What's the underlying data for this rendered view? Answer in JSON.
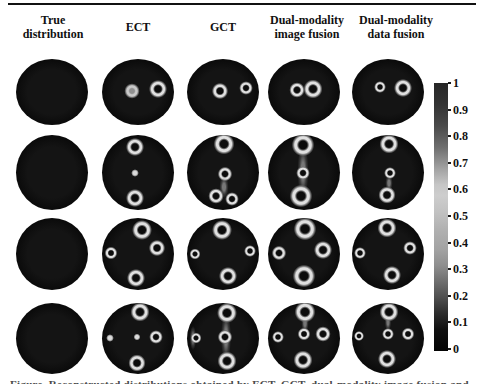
{
  "figure": {
    "columns": [
      {
        "label": "True\ndistribution"
      },
      {
        "label": "ECT"
      },
      {
        "label": "GCT"
      },
      {
        "label": "Dual-modality\nimage fusion"
      },
      {
        "label": "Dual-modality\ndata fusion"
      }
    ],
    "caption_fragment": "Figure. Reconstructed distributions obtained by ECT, GCT, dual-modality image fusion and dual-modality data fusion"
  },
  "colorbar": {
    "max": "1",
    "min": "0",
    "labels": [
      "1",
      "0.9",
      "0.8",
      "0.7",
      "0.6",
      "0.5",
      "0.4",
      "0.3",
      "0.2",
      "0.1",
      "0"
    ],
    "colormap_grayscale": [
      "#272727",
      "#cdcdcd",
      "#a3a3a3",
      "#4f4f4f",
      "#040404"
    ]
  },
  "colors": {
    "background": "#ffffff",
    "disc": "#0d0d0d",
    "ring_bright": "#e0e0e0",
    "text": "#111111"
  },
  "grid": {
    "cols": [
      {
        "cx": 52
      },
      {
        "cx": 138
      },
      {
        "cx": 223
      },
      {
        "cx": 304
      },
      {
        "cx": 388
      }
    ],
    "rows": [
      {
        "cy": 92,
        "h": 66
      },
      {
        "cy": 172,
        "h": 75
      },
      {
        "cy": 254,
        "h": 72
      },
      {
        "cy": 338,
        "h": 71
      }
    ],
    "cells": [
      [
        [],
        [
          {
            "x": 42,
            "y": 49,
            "d": 17,
            "t": "ring2"
          },
          {
            "x": 78,
            "y": 45,
            "d": 20,
            "t": "ring"
          }
        ],
        [
          {
            "x": 46,
            "y": 48,
            "d": 18,
            "t": "ring"
          },
          {
            "x": 82,
            "y": 44,
            "d": 15,
            "t": "ring"
          }
        ],
        [
          {
            "x": 40,
            "y": 47,
            "d": 17,
            "t": "ring"
          },
          {
            "x": 63,
            "y": 45,
            "d": 21,
            "t": "ring"
          }
        ],
        [
          {
            "x": 39,
            "y": 43,
            "d": 13,
            "t": "ring"
          },
          {
            "x": 71,
            "y": 44,
            "d": 20,
            "t": "ring"
          }
        ]
      ],
      [
        [],
        [
          {
            "x": 46,
            "y": 16,
            "d": 20,
            "t": "ring"
          },
          {
            "x": 46,
            "y": 51,
            "d": 9,
            "t": "dot"
          },
          {
            "x": 46,
            "y": 84,
            "d": 20,
            "t": "ring"
          }
        ],
        [
          {
            "x": 52,
            "y": 13,
            "d": 23,
            "t": "ring"
          },
          {
            "x": 53,
            "y": 52,
            "d": 16,
            "t": "ring"
          },
          {
            "x": 52,
            "y": 70,
            "d": 10,
            "h": 24,
            "t": "smearV"
          },
          {
            "x": 40,
            "y": 82,
            "d": 17,
            "t": "ring"
          },
          {
            "x": 62,
            "y": 86,
            "d": 15,
            "t": "ring"
          }
        ],
        [
          {
            "x": 48,
            "y": 48,
            "d": 12,
            "h": 58,
            "t": "smearV"
          },
          {
            "x": 48,
            "y": 14,
            "d": 25,
            "t": "ring"
          },
          {
            "x": 49,
            "y": 51,
            "d": 15,
            "t": "ring"
          },
          {
            "x": 46,
            "y": 82,
            "d": 25,
            "t": "ring"
          }
        ],
        [
          {
            "x": 52,
            "y": 64,
            "d": 8,
            "h": 18,
            "t": "smearV"
          },
          {
            "x": 52,
            "y": 13,
            "d": 21,
            "t": "ring"
          },
          {
            "x": 53,
            "y": 51,
            "d": 13,
            "t": "ring"
          },
          {
            "x": 49,
            "y": 81,
            "d": 19,
            "t": "ring"
          }
        ]
      ],
      [
        [],
        [
          {
            "x": 55,
            "y": 16,
            "d": 22,
            "t": "ring"
          },
          {
            "x": 13,
            "y": 49,
            "d": 14,
            "t": "ring"
          },
          {
            "x": 76,
            "y": 42,
            "d": 18,
            "t": "ring"
          },
          {
            "x": 47,
            "y": 84,
            "d": 20,
            "t": "ring"
          }
        ],
        [
          {
            "x": 49,
            "y": 16,
            "d": 22,
            "t": "ring"
          },
          {
            "x": 11,
            "y": 50,
            "d": 12,
            "t": "ring"
          },
          {
            "x": 88,
            "y": 46,
            "d": 13,
            "t": "ring"
          },
          {
            "x": 57,
            "y": 81,
            "d": 20,
            "t": "ring"
          }
        ],
        [
          {
            "x": 51,
            "y": 15,
            "d": 25,
            "t": "ring"
          },
          {
            "x": 15,
            "y": 48,
            "d": 16,
            "t": "ring"
          },
          {
            "x": 77,
            "y": 44,
            "d": 20,
            "t": "ring"
          },
          {
            "x": 50,
            "y": 81,
            "d": 25,
            "t": "ring"
          }
        ],
        [
          {
            "x": 48,
            "y": 14,
            "d": 21,
            "t": "ring"
          },
          {
            "x": 11,
            "y": 49,
            "d": 13,
            "t": "ring"
          },
          {
            "x": 81,
            "y": 42,
            "d": 15,
            "t": "ring"
          },
          {
            "x": 56,
            "y": 79,
            "d": 20,
            "t": "ring"
          }
        ]
      ],
      [
        [],
        [
          {
            "x": 53,
            "y": 13,
            "d": 21,
            "t": "ring"
          },
          {
            "x": 11,
            "y": 50,
            "d": 9,
            "t": "dot"
          },
          {
            "x": 49,
            "y": 48,
            "d": 8,
            "t": "dot"
          },
          {
            "x": 75,
            "y": 48,
            "d": 15,
            "t": "ring"
          },
          {
            "x": 49,
            "y": 85,
            "d": 19,
            "t": "ring"
          }
        ],
        [
          {
            "x": 54,
            "y": 49,
            "d": 11,
            "h": 54,
            "t": "smearV"
          },
          {
            "x": 8,
            "y": 50,
            "d": 7,
            "h": 26,
            "t": "smearV"
          },
          {
            "x": 55,
            "y": 15,
            "d": 22,
            "t": "ring"
          },
          {
            "x": 53,
            "y": 48,
            "d": 16,
            "t": "ring"
          },
          {
            "x": 13,
            "y": 50,
            "d": 12,
            "t": "ring"
          },
          {
            "x": 55,
            "y": 83,
            "d": 21,
            "t": "ring"
          }
        ],
        [
          {
            "x": 51,
            "y": 29,
            "d": 8,
            "h": 22,
            "t": "smearV"
          },
          {
            "x": 52,
            "y": 14,
            "d": 23,
            "t": "ring"
          },
          {
            "x": 50,
            "y": 44,
            "d": 14,
            "t": "ring"
          },
          {
            "x": 14,
            "y": 48,
            "d": 13,
            "t": "ring"
          },
          {
            "x": 77,
            "y": 45,
            "d": 17,
            "t": "ring"
          },
          {
            "x": 48,
            "y": 81,
            "d": 21,
            "t": "ring"
          }
        ],
        [
          {
            "x": 50,
            "y": 28,
            "d": 7,
            "h": 20,
            "t": "smearV"
          },
          {
            "x": 51,
            "y": 13,
            "d": 21,
            "t": "ring"
          },
          {
            "x": 50,
            "y": 44,
            "d": 13,
            "t": "ring"
          },
          {
            "x": 10,
            "y": 47,
            "d": 11,
            "t": "ring"
          },
          {
            "x": 78,
            "y": 44,
            "d": 14,
            "t": "ring"
          },
          {
            "x": 48,
            "y": 80,
            "d": 20,
            "t": "ring"
          }
        ]
      ]
    ]
  }
}
